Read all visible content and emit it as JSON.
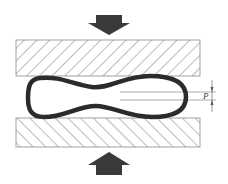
{
  "diagram": {
    "top_force": {
      "icon": "arrow-down-icon",
      "color": "#3a3a3a"
    },
    "bottom_force": {
      "icon": "arrow-up-icon",
      "color": "#3a3a3a"
    },
    "top_plate": {
      "hatch": "diagonal-down-right",
      "stroke": "#6a6a6a"
    },
    "bottom_plate": {
      "hatch": "diagonal-up-right",
      "stroke": "#6a6a6a"
    },
    "tube": {
      "shape": "peanut-cross-section",
      "stroke": "#2b2b2b"
    },
    "dimension": {
      "label": "P",
      "line_color": "#777777"
    }
  }
}
